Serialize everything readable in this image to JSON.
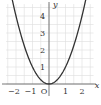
{
  "chart_data": {
    "type": "line",
    "title": "",
    "function": "y = x^2",
    "xlabel": "x",
    "ylabel": "y",
    "origin_label": "O",
    "x_ticks": [
      -2,
      -1,
      1,
      2
    ],
    "x_tick_labels": [
      "−2",
      "−1",
      "1",
      "2"
    ],
    "y_ticks": [
      1,
      2,
      3,
      4
    ],
    "y_tick_labels": [
      "1",
      "2",
      "3",
      "4"
    ],
    "xlim": [
      -2.6,
      2.7
    ],
    "ylim": [
      0,
      4.7
    ],
    "grid": true,
    "grid_step": 0.5,
    "series": [
      {
        "name": "y = x^2",
        "x": [
          -2.2,
          -2,
          -1.5,
          -1,
          -0.5,
          0,
          0.5,
          1,
          1.5,
          2,
          2.2
        ],
        "y": [
          4.84,
          4,
          2.25,
          1,
          0.25,
          0,
          0.25,
          1,
          2.25,
          4,
          4.84
        ]
      }
    ],
    "colors": {
      "curve": "#333333",
      "axis": "#555555",
      "grid": "#dddddd"
    }
  }
}
